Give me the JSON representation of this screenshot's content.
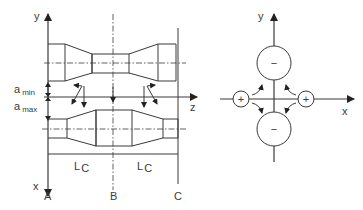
{
  "left_diagram": {
    "axes": {
      "y": "y",
      "z": "z",
      "x": "x"
    },
    "dimensions": {
      "a_min": {
        "main": "a",
        "sub": "min"
      },
      "a_max": {
        "main": "a",
        "sub": "max"
      }
    },
    "lengths": [
      {
        "main": "L",
        "sub": "C"
      },
      {
        "main": "L",
        "sub": "C"
      }
    ],
    "sections": [
      "A",
      "B",
      "C"
    ]
  },
  "right_diagram": {
    "axes": {
      "y": "y",
      "x": "x"
    },
    "poles": [
      {
        "sign": "−",
        "position": "top"
      },
      {
        "sign": "−",
        "position": "bottom"
      },
      {
        "sign": "+",
        "position": "left"
      },
      {
        "sign": "+",
        "position": "right"
      }
    ]
  }
}
